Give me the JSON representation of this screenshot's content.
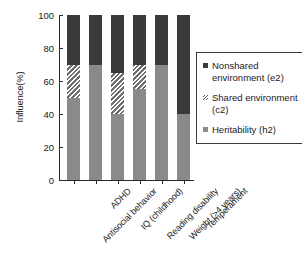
{
  "chart_data": {
    "type": "bar",
    "stacked": true,
    "title": "",
    "xlabel": "",
    "ylabel": "Influence(%)",
    "ylim": [
      0,
      100
    ],
    "yticks": [
      0,
      20,
      40,
      60,
      80,
      100
    ],
    "grid": false,
    "legend_position": "right",
    "categories": [
      "Antisocial behavior",
      "ADHD",
      "IQ (childhood)",
      "Reading disability",
      "Weight (>4 years)",
      "Temperament"
    ],
    "series": [
      {
        "name": "Heritability (h2)",
        "key": "h2",
        "color": "#8a8a8a",
        "values": [
          50,
          70,
          40,
          55,
          70,
          40
        ]
      },
      {
        "name": "Shared environment (c2)",
        "key": "c2",
        "color": "hatched",
        "values": [
          20,
          0,
          25,
          15,
          0,
          0
        ]
      },
      {
        "name": "Nonshared environment (e2)",
        "key": "e2",
        "color": "#3a3a3a",
        "values": [
          30,
          30,
          35,
          30,
          30,
          60
        ]
      }
    ]
  },
  "axis": {
    "y_title": "Influence(%)",
    "y_tick_labels": [
      "0",
      "20",
      "40",
      "60",
      "80",
      "100"
    ]
  },
  "legend": {
    "items": [
      {
        "label": "Nonshared environment (e2)",
        "swatch": "dark-square-icon"
      },
      {
        "label": "Shared environment (c2)",
        "swatch": "hatched-square-icon"
      },
      {
        "label": "Heritability (h2)",
        "swatch": "gray-square-icon"
      }
    ]
  },
  "colors": {
    "heritability": "#8a8a8a",
    "nonshared": "#3a3a3a",
    "axis": "#2a2a2a",
    "background": "#ffffff"
  },
  "caption": ""
}
